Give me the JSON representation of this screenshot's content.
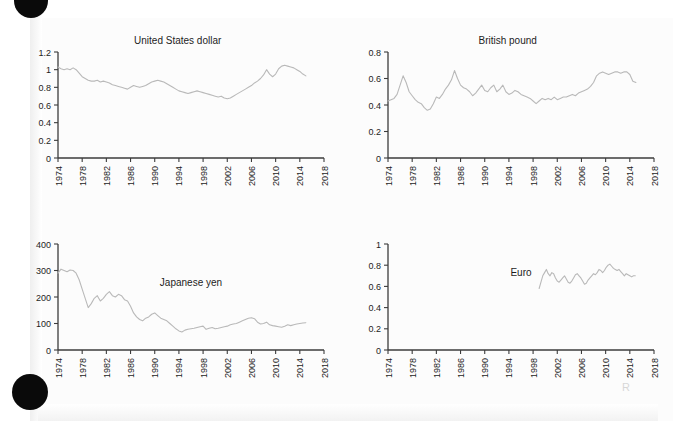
{
  "page": {
    "background_color": "#ffffff",
    "paper_color": "#fcfcfc",
    "line_color": "#b9b9b9",
    "axis_color": "#3c3c3c",
    "text_color": "#1d1d1d",
    "artifacts": {
      "hole_top_name": "punch-hole-mark-top",
      "hole_bottom_name": "punch-hole-mark-bottom",
      "smudge_text": "R"
    }
  },
  "chart_data": [
    {
      "id": "united-states-dollar",
      "type": "line",
      "title": "United States dollar",
      "title_position": "top-center",
      "xlabel": "",
      "ylabel": "",
      "xlim": [
        1974,
        2018
      ],
      "ylim": [
        0,
        1.2
      ],
      "xticks": [
        1974,
        1978,
        1982,
        1986,
        1990,
        1994,
        1998,
        2002,
        2006,
        2010,
        2014,
        2018
      ],
      "xticklabels": [
        "1974",
        "1978",
        "1982",
        "1986",
        "1990",
        "1994",
        "1998",
        "2002",
        "2006",
        "2010",
        "2014",
        "2018"
      ],
      "yticks": [
        0,
        0.2,
        0.4,
        0.6,
        0.8,
        1,
        1.2
      ],
      "yticklabels": [
        "0",
        "0.2",
        "0.4",
        "0.6",
        "0.8",
        "1",
        "1.2"
      ],
      "grid": false,
      "legend": "none",
      "x": [
        1974.0,
        1974.5,
        1975.0,
        1975.5,
        1976.0,
        1976.5,
        1977.0,
        1977.5,
        1978.0,
        1978.5,
        1979.0,
        1979.5,
        1980.0,
        1980.5,
        1981.0,
        1981.5,
        1982.0,
        1982.5,
        1983.0,
        1983.5,
        1984.0,
        1984.5,
        1985.0,
        1985.5,
        1986.0,
        1986.5,
        1987.0,
        1987.5,
        1988.0,
        1988.5,
        1989.0,
        1989.5,
        1990.0,
        1990.5,
        1991.0,
        1991.5,
        1992.0,
        1992.5,
        1993.0,
        1993.5,
        1994.0,
        1994.5,
        1995.0,
        1995.5,
        1996.0,
        1996.5,
        1997.0,
        1997.5,
        1998.0,
        1998.5,
        1999.0,
        1999.5,
        2000.0,
        2000.5,
        2001.0,
        2001.5,
        2002.0,
        2002.5,
        2003.0,
        2003.5,
        2004.0,
        2004.5,
        2005.0,
        2005.5,
        2006.0,
        2006.5,
        2007.0,
        2007.5,
        2008.0,
        2008.5,
        2009.0,
        2009.5,
        2010.0,
        2010.5,
        2011.0,
        2011.5,
        2012.0,
        2012.5,
        2013.0,
        2013.5,
        2014.0,
        2014.5,
        2015.0
      ],
      "y": [
        1.03,
        1.01,
        1.0,
        1.01,
        1.0,
        1.02,
        1.0,
        0.96,
        0.92,
        0.9,
        0.88,
        0.87,
        0.87,
        0.88,
        0.86,
        0.87,
        0.86,
        0.85,
        0.83,
        0.82,
        0.81,
        0.8,
        0.79,
        0.78,
        0.8,
        0.82,
        0.81,
        0.8,
        0.81,
        0.82,
        0.84,
        0.86,
        0.87,
        0.88,
        0.87,
        0.86,
        0.84,
        0.82,
        0.8,
        0.78,
        0.76,
        0.75,
        0.74,
        0.73,
        0.74,
        0.75,
        0.76,
        0.75,
        0.74,
        0.73,
        0.72,
        0.71,
        0.7,
        0.69,
        0.7,
        0.68,
        0.67,
        0.68,
        0.7,
        0.72,
        0.74,
        0.76,
        0.78,
        0.8,
        0.82,
        0.85,
        0.87,
        0.9,
        0.94,
        1.0,
        0.95,
        0.92,
        0.95,
        1.01,
        1.04,
        1.05,
        1.04,
        1.03,
        1.02,
        1.0,
        0.98,
        0.95,
        0.93
      ]
    },
    {
      "id": "british-pound",
      "type": "line",
      "title": "British pound",
      "title_position": "top-center",
      "xlabel": "",
      "ylabel": "",
      "xlim": [
        1974,
        2018
      ],
      "ylim": [
        0,
        0.8
      ],
      "xticks": [
        1974,
        1978,
        1982,
        1986,
        1990,
        1994,
        1998,
        2002,
        2006,
        2010,
        2014,
        2018
      ],
      "xticklabels": [
        "1974",
        "1978",
        "1982",
        "1986",
        "1990",
        "1994",
        "1998",
        "2002",
        "2006",
        "2010",
        "2014",
        "2018"
      ],
      "yticks": [
        0,
        0.2,
        0.4,
        0.6,
        0.8
      ],
      "yticklabels": [
        "0",
        "0.2",
        "0.4",
        "0.6",
        "0.8"
      ],
      "grid": false,
      "legend": "none",
      "x": [
        1974.0,
        1974.5,
        1975.0,
        1975.5,
        1976.0,
        1976.5,
        1977.0,
        1977.5,
        1978.0,
        1978.5,
        1979.0,
        1979.5,
        1980.0,
        1980.5,
        1981.0,
        1981.5,
        1982.0,
        1982.5,
        1983.0,
        1983.5,
        1984.0,
        1984.5,
        1985.0,
        1985.5,
        1986.0,
        1986.5,
        1987.0,
        1987.5,
        1988.0,
        1988.5,
        1989.0,
        1989.5,
        1990.0,
        1990.5,
        1991.0,
        1991.5,
        1992.0,
        1992.5,
        1993.0,
        1993.5,
        1994.0,
        1994.5,
        1995.0,
        1995.5,
        1996.0,
        1996.5,
        1997.0,
        1997.5,
        1998.0,
        1998.5,
        1999.0,
        1999.5,
        2000.0,
        2000.5,
        2001.0,
        2001.5,
        2002.0,
        2002.5,
        2003.0,
        2003.5,
        2004.0,
        2004.5,
        2005.0,
        2005.5,
        2006.0,
        2006.5,
        2007.0,
        2007.5,
        2008.0,
        2008.5,
        2009.0,
        2009.5,
        2010.0,
        2010.5,
        2011.0,
        2011.5,
        2012.0,
        2012.5,
        2013.0,
        2013.5,
        2014.0,
        2014.5,
        2015.0
      ],
      "y": [
        0.43,
        0.44,
        0.45,
        0.48,
        0.55,
        0.62,
        0.57,
        0.5,
        0.47,
        0.44,
        0.42,
        0.41,
        0.38,
        0.36,
        0.37,
        0.41,
        0.46,
        0.45,
        0.48,
        0.52,
        0.55,
        0.59,
        0.66,
        0.6,
        0.55,
        0.53,
        0.52,
        0.5,
        0.47,
        0.49,
        0.52,
        0.55,
        0.51,
        0.5,
        0.53,
        0.55,
        0.5,
        0.52,
        0.55,
        0.5,
        0.48,
        0.49,
        0.51,
        0.5,
        0.48,
        0.47,
        0.46,
        0.45,
        0.43,
        0.41,
        0.43,
        0.45,
        0.44,
        0.45,
        0.44,
        0.46,
        0.44,
        0.45,
        0.46,
        0.46,
        0.47,
        0.48,
        0.47,
        0.49,
        0.5,
        0.51,
        0.52,
        0.54,
        0.57,
        0.62,
        0.64,
        0.65,
        0.64,
        0.63,
        0.64,
        0.65,
        0.65,
        0.64,
        0.65,
        0.65,
        0.63,
        0.58,
        0.57
      ]
    },
    {
      "id": "japanese-yen",
      "type": "line",
      "title": "Japanese yen",
      "title_position": "inside-center",
      "xlabel": "",
      "ylabel": "",
      "xlim": [
        1974,
        2018
      ],
      "ylim": [
        0,
        400
      ],
      "xticks": [
        1974,
        1978,
        1982,
        1986,
        1990,
        1994,
        1998,
        2002,
        2006,
        2010,
        2014,
        2018
      ],
      "xticklabels": [
        "1974",
        "1978",
        "1982",
        "1986",
        "1990",
        "1994",
        "1998",
        "2002",
        "2006",
        "2010",
        "2014",
        "2018"
      ],
      "yticks": [
        0,
        100,
        200,
        300,
        400
      ],
      "yticklabels": [
        "0",
        "100",
        "200",
        "300",
        "400"
      ],
      "grid": false,
      "legend": "none",
      "x": [
        1974.0,
        1974.5,
        1975.0,
        1975.5,
        1976.0,
        1976.5,
        1977.0,
        1977.5,
        1978.0,
        1978.5,
        1979.0,
        1979.5,
        1980.0,
        1980.5,
        1981.0,
        1981.5,
        1982.0,
        1982.5,
        1983.0,
        1983.5,
        1984.0,
        1984.5,
        1985.0,
        1985.5,
        1986.0,
        1986.5,
        1987.0,
        1987.5,
        1988.0,
        1988.5,
        1989.0,
        1989.5,
        1990.0,
        1990.5,
        1991.0,
        1991.5,
        1992.0,
        1992.5,
        1993.0,
        1993.5,
        1994.0,
        1994.5,
        1995.0,
        1995.5,
        1996.0,
        1996.5,
        1997.0,
        1997.5,
        1998.0,
        1998.5,
        1999.0,
        1999.5,
        2000.0,
        2000.5,
        2001.0,
        2001.5,
        2002.0,
        2002.5,
        2003.0,
        2003.5,
        2004.0,
        2004.5,
        2005.0,
        2005.5,
        2006.0,
        2006.5,
        2007.0,
        2007.5,
        2008.0,
        2008.5,
        2009.0,
        2009.5,
        2010.0,
        2010.5,
        2011.0,
        2011.5,
        2012.0,
        2012.5,
        2013.0,
        2013.5,
        2014.0,
        2014.5,
        2015.0
      ],
      "y": [
        290,
        305,
        300,
        295,
        302,
        300,
        290,
        265,
        230,
        195,
        160,
        175,
        195,
        205,
        185,
        195,
        210,
        220,
        205,
        200,
        210,
        205,
        190,
        185,
        165,
        140,
        125,
        115,
        110,
        120,
        125,
        135,
        140,
        130,
        120,
        115,
        110,
        100,
        90,
        80,
        72,
        68,
        75,
        78,
        80,
        82,
        85,
        88,
        90,
        78,
        82,
        85,
        80,
        82,
        85,
        88,
        90,
        95,
        98,
        100,
        105,
        110,
        115,
        120,
        122,
        118,
        105,
        98,
        100,
        105,
        95,
        92,
        90,
        88,
        86,
        90,
        95,
        92,
        95,
        98,
        100,
        102,
        103
      ]
    },
    {
      "id": "euro",
      "type": "line",
      "title": "Euro",
      "title_position": "inside-left",
      "xlabel": "",
      "ylabel": "",
      "xlim": [
        1974,
        2018
      ],
      "ylim": [
        0,
        1
      ],
      "xticks": [
        1974,
        1978,
        1982,
        1986,
        1990,
        1994,
        1998,
        2002,
        2006,
        2010,
        2014,
        2018
      ],
      "xticklabels": [
        "1974",
        "1978",
        "1982",
        "1986",
        "1990",
        "1994",
        "1998",
        "2002",
        "2006",
        "2010",
        "2014",
        "2018"
      ],
      "yticks": [
        0,
        0.2,
        0.4,
        0.6,
        0.8,
        1
      ],
      "yticklabels": [
        "0",
        "0.2",
        "0.4",
        "0.6",
        "0.8",
        "1"
      ],
      "grid": false,
      "legend": "none",
      "x": [
        1999.0,
        1999.3,
        1999.6,
        1999.9,
        2000.2,
        2000.5,
        2000.8,
        2001.1,
        2001.4,
        2001.7,
        2002.0,
        2002.3,
        2002.6,
        2002.9,
        2003.2,
        2003.5,
        2003.8,
        2004.1,
        2004.4,
        2004.7,
        2005.0,
        2005.3,
        2005.6,
        2005.9,
        2006.2,
        2006.5,
        2006.8,
        2007.1,
        2007.4,
        2007.7,
        2008.0,
        2008.3,
        2008.6,
        2008.9,
        2009.2,
        2009.5,
        2009.8,
        2010.1,
        2010.4,
        2010.7,
        2011.0,
        2011.3,
        2011.6,
        2011.9,
        2012.2,
        2012.5,
        2012.8,
        2013.1,
        2013.4,
        2013.7,
        2014.0,
        2014.3,
        2014.6,
        2014.9
      ],
      "y": [
        0.58,
        0.64,
        0.7,
        0.73,
        0.76,
        0.72,
        0.7,
        0.73,
        0.72,
        0.68,
        0.65,
        0.64,
        0.66,
        0.68,
        0.7,
        0.67,
        0.64,
        0.63,
        0.65,
        0.68,
        0.71,
        0.72,
        0.7,
        0.68,
        0.65,
        0.62,
        0.63,
        0.66,
        0.68,
        0.7,
        0.72,
        0.71,
        0.73,
        0.76,
        0.75,
        0.73,
        0.75,
        0.78,
        0.8,
        0.81,
        0.79,
        0.77,
        0.76,
        0.75,
        0.76,
        0.74,
        0.72,
        0.7,
        0.72,
        0.71,
        0.7,
        0.69,
        0.7,
        0.7
      ]
    }
  ]
}
